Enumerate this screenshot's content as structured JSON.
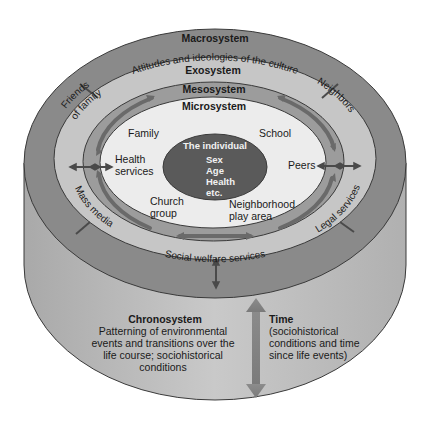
{
  "diagram": {
    "type": "bronfenbrenner-ecological-model",
    "colors": {
      "background": "#ffffff",
      "cylinder_side": "#b8b8b8",
      "macrosystem": "#8a8a8a",
      "exosystem": "#c6c6c6",
      "mesosystem": "#9c9c9c",
      "microsystem": "#ececec",
      "individual": "#5a5a5a",
      "arrow": "#6e6e6e",
      "outline": "#3a3a3a"
    },
    "macrosystem": {
      "title": "Macrosystem",
      "subtitle": "Attitudes and ideologies of the culture"
    },
    "exosystem": {
      "title": "Exosystem",
      "items": {
        "friends_line1": "Friends",
        "friends_line2": "of family",
        "neighbors": "Neighbors",
        "mass_media": "Mass media",
        "legal_services": "Legal services",
        "social_welfare": "Social welfare services"
      }
    },
    "mesosystem": {
      "title": "Mesosystem"
    },
    "microsystem": {
      "title": "Microsystem",
      "items": {
        "family": "Family",
        "school": "School",
        "health_line1": "Health",
        "health_line2": "services",
        "peers": "Peers",
        "church_line1": "Church",
        "church_line2": "group",
        "neighborhood_line1": "Neighborhood",
        "neighborhood_line2": "play area"
      }
    },
    "individual": {
      "title": "The individual",
      "attributes": [
        "Sex",
        "Age",
        "Health",
        "etc."
      ]
    },
    "chronosystem": {
      "title": "Chronosystem",
      "lines": [
        "Patterning of environmental",
        "events and transitions over the",
        "life course; sociohistorical",
        "conditions"
      ]
    },
    "time": {
      "title": "Time",
      "lines": [
        "(sociohistorical",
        "conditions and time",
        "since life events)"
      ]
    }
  }
}
